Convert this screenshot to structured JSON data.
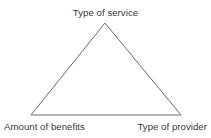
{
  "figure": {
    "type": "triangle-diagram",
    "background_color": "#ffffff",
    "stroke_color": "#6b6b6b",
    "stroke_width": 1,
    "label_color": "#3a3a3a",
    "filled": false
  },
  "chart_data": {
    "type": "diagram",
    "shape": "triangle",
    "title": "",
    "nodes": [
      {
        "id": "apex",
        "label": "Type of service",
        "position": "top-center",
        "x": 105,
        "y": 23
      },
      {
        "id": "bottom-left",
        "label": "Amount of benefits",
        "position": "bottom-left",
        "x": 31,
        "y": 115
      },
      {
        "id": "bottom-right",
        "label": "Type of provider",
        "position": "bottom-right",
        "x": 181,
        "y": 115
      }
    ],
    "edges": [
      {
        "from": "apex",
        "to": "bottom-right"
      },
      {
        "from": "bottom-right",
        "to": "bottom-left"
      },
      {
        "from": "bottom-left",
        "to": "apex"
      }
    ],
    "vertices_points": "105,23 181,115 31,115",
    "legend": [],
    "annotations": []
  },
  "labels": {
    "apex": "Type of service",
    "bottom_left": "Amount of benefits",
    "bottom_right": "Type of provider"
  }
}
